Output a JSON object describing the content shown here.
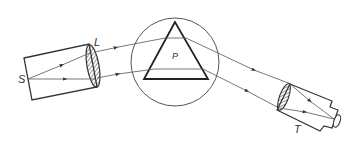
{
  "diagram": {
    "labels": {
      "source": "S",
      "lens": "L",
      "prism": "P",
      "telescope": "T"
    },
    "components": [
      {
        "id": "S",
        "name": "source slit"
      },
      {
        "id": "L",
        "name": "collimator lens"
      },
      {
        "id": "P",
        "name": "prism on table"
      },
      {
        "id": "T",
        "name": "telescope"
      }
    ],
    "colors": {
      "stroke": "#333333",
      "ray": "#555555",
      "background": "#ffffff"
    }
  }
}
